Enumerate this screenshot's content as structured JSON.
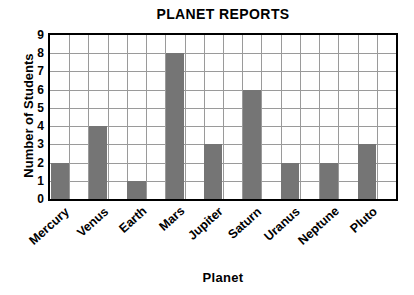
{
  "chart_data": {
    "type": "bar",
    "title": "PLANET REPORTS",
    "xlabel": "Planet",
    "ylabel": "Number of Students",
    "categories": [
      "Mercury",
      "Venus",
      "Earth",
      "Mars",
      "Jupiter",
      "Saturn",
      "Uranus",
      "Neptune",
      "Pluto"
    ],
    "values": [
      2,
      4,
      1,
      8,
      3,
      6,
      2,
      2,
      3
    ],
    "ylim": [
      0,
      9
    ],
    "ytick_labels": [
      "0",
      "1",
      "2",
      "3",
      "4",
      "5",
      "6",
      "7",
      "8",
      "9"
    ],
    "grid": true,
    "legend": null,
    "bar_color": "#757575",
    "grid_color": "#9a9a9a",
    "axis_color": "#000000",
    "background_color": "#ffffff"
  }
}
